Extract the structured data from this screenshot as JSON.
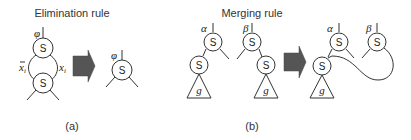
{
  "panel_a": {
    "title": "Elimination rule",
    "caption": "(a)",
    "top_node": {
      "label": "S",
      "annotation": "φ"
    },
    "bottom_node": {
      "label": "S"
    },
    "edge_left_label": "x",
    "edge_left_sub": "i",
    "edge_left_negated": true,
    "edge_right_label": "x",
    "edge_right_sub": "i",
    "result_node": {
      "label": "S",
      "annotation": "φ"
    },
    "arrow_color": "#555555"
  },
  "panel_b": {
    "title": "Merging rule",
    "caption": "(b)",
    "left_tree": {
      "root_label": "S",
      "root_annotation": "α",
      "child_label": "S",
      "subtree_label": "g"
    },
    "right_tree": {
      "root_label": "S",
      "root_annotation": "β",
      "child_label": "S",
      "subtree_label": "g"
    },
    "result": {
      "alpha_node": {
        "label": "S",
        "annotation": "α"
      },
      "beta_node": {
        "label": "S",
        "annotation": "β"
      },
      "shared_child": {
        "label": "S"
      },
      "subtree_label": "g"
    },
    "arrow_color": "#555555"
  }
}
